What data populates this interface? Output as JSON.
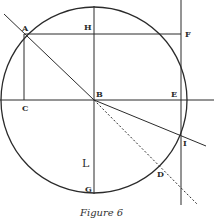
{
  "figure": {
    "caption": "Figure 6",
    "circle": {
      "cx": 94,
      "cy": 100,
      "r": 93
    },
    "points": {
      "A": {
        "label": "A",
        "x": 24,
        "y": 34
      },
      "B": {
        "label": "B",
        "x": 94,
        "y": 100
      },
      "C": {
        "label": "C",
        "x": 24,
        "y": 100
      },
      "D": {
        "label": "D",
        "x": 158,
        "y": 168
      },
      "E": {
        "label": "E",
        "x": 181,
        "y": 100
      },
      "F": {
        "label": "F",
        "x": 181,
        "y": 34
      },
      "G": {
        "label": "G",
        "x": 94,
        "y": 193
      },
      "H": {
        "label": "H",
        "x": 94,
        "y": 34
      },
      "I": {
        "label": "I",
        "x": 181,
        "y": 134
      },
      "L": {
        "label": "L",
        "x": 94,
        "y": 160
      }
    },
    "lines": [
      {
        "name": "line-A-B",
        "from": "A",
        "to": "B",
        "style": "solid",
        "extends_beyond": "A"
      },
      {
        "name": "line-B-I",
        "from": "B",
        "to": "I",
        "style": "solid",
        "extends_beyond": "I"
      },
      {
        "name": "line-B-D",
        "from": "B",
        "to": "D",
        "style": "dotted",
        "extends_beyond": "D"
      },
      {
        "name": "line-horizontal-C-E",
        "from": "C",
        "to": "E",
        "style": "solid"
      },
      {
        "name": "line-horizontal-A-F",
        "from": "A",
        "to": "F",
        "style": "solid"
      },
      {
        "name": "line-vertical-A-C",
        "from": "A",
        "to": "C",
        "style": "solid"
      },
      {
        "name": "line-vertical-H-G",
        "from": "H",
        "to": "G",
        "style": "solid"
      },
      {
        "name": "line-vertical-F-I",
        "from": "F",
        "to": "I",
        "style": "solid"
      }
    ]
  }
}
